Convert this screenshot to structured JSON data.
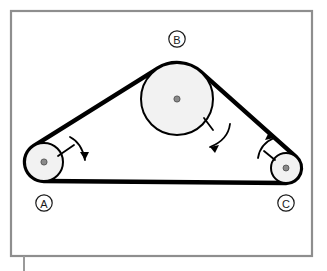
{
  "figure": {
    "background_color": "#ffffff",
    "frame": {
      "name": "figure-border",
      "color": "#8e8e8e",
      "x": 11,
      "y": 11,
      "width": 301,
      "height": 245,
      "stroke_width": 2.2
    },
    "tick_mark": {
      "name": "bottom-axis-tick",
      "color": "#9a9a9a",
      "x": 24,
      "y_top": 256,
      "y_bottom": 271,
      "stroke_width": 2
    },
    "belt": {
      "name": "drive-belt",
      "color": "#000000",
      "stroke_width": 4.4,
      "fill": "none"
    },
    "pulleys": [
      {
        "id": "A",
        "label": "A",
        "name": "pulley-a",
        "cx": 44,
        "cy": 162,
        "r": 19,
        "hub_r": 3.1,
        "face_color": "#f2f2f2",
        "edge_color": "#000000",
        "edge_width": 2.0,
        "hub_color": "#8a8a8a",
        "label_cx": 44,
        "label_cy": 203,
        "label_r": 8.2
      },
      {
        "id": "B",
        "label": "B",
        "name": "pulley-b",
        "cx": 177,
        "cy": 99,
        "r": 36,
        "hub_r": 3.1,
        "face_color": "#f2f2f2",
        "edge_color": "#000000",
        "edge_width": 2.0,
        "hub_color": "#8a8a8a",
        "label_cx": 177,
        "label_cy": 39,
        "label_r": 8.2
      },
      {
        "id": "C",
        "label": "C",
        "name": "pulley-c",
        "cx": 286,
        "cy": 168,
        "r": 15,
        "hub_r": 3.0,
        "face_color": "#f2f2f2",
        "edge_color": "#000000",
        "edge_width": 2.0,
        "hub_color": "#8a8a8a",
        "label_cx": 286,
        "label_cy": 203,
        "label_r": 8.2
      }
    ],
    "rotation_arrows": [
      {
        "id": "arrow-a",
        "name": "rotation-arrow-pulley-a",
        "pulley": "A",
        "direction": "clockwise",
        "color": "#000000",
        "spoke": {
          "x1": 58,
          "y1": 156,
          "x2": 74,
          "y2": 145
        },
        "arc": "M 70 137 Q 82 143 85 160",
        "head": "M 85 160 L 80 152 L 89 152 Z"
      },
      {
        "id": "arrow-b",
        "name": "rotation-arrow-pulley-b",
        "pulley": "B",
        "direction": "clockwise",
        "color": "#000000",
        "spoke": {
          "x1": 204,
          "y1": 118,
          "x2": 213,
          "y2": 130
        },
        "arc": "M 230 124 Q 228 140 210 147",
        "head": "M 210 147 L 219 145 L 215 153 Z"
      },
      {
        "id": "arrow-c",
        "name": "rotation-arrow-pulley-c",
        "pulley": "C",
        "direction": "counterclockwise",
        "color": "#000000",
        "spoke": {
          "x1": 275,
          "y1": 160,
          "x2": 264,
          "y2": 151
        },
        "arc": "M 258 158 Q 260 144 274 138",
        "head": "M 274 138 L 265 140 L 269 132 Z"
      }
    ]
  }
}
